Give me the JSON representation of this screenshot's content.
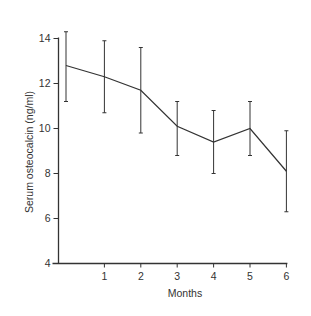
{
  "chart_data": {
    "type": "line",
    "title": "",
    "xlabel": "Months",
    "ylabel": "Serum osteocalcin (ng/ml)",
    "x": [
      0,
      1,
      2,
      3,
      4,
      5,
      6
    ],
    "x_tick_labels": [
      "1",
      "2",
      "3",
      "4",
      "5",
      "6"
    ],
    "x_ticks": [
      1,
      2,
      3,
      4,
      5,
      6
    ],
    "y_ticks": [
      4,
      6,
      8,
      10,
      12,
      14
    ],
    "y_tick_labels": [
      "4",
      "6",
      "8",
      "10",
      "12",
      "14"
    ],
    "ylim": [
      4,
      14
    ],
    "xlim": [
      0,
      6
    ],
    "grid": false,
    "legend": null,
    "series": [
      {
        "name": "Serum osteocalcin",
        "values": [
          12.8,
          12.3,
          11.7,
          10.1,
          9.4,
          10.0,
          8.1
        ],
        "error_upper": [
          14.3,
          13.9,
          13.6,
          11.2,
          10.8,
          11.2,
          9.9
        ],
        "error_lower": [
          11.2,
          10.7,
          9.8,
          8.8,
          8.0,
          8.8,
          6.3
        ]
      }
    ],
    "colors": {
      "line": "#333333",
      "axis": "#333333",
      "background": "#ffffff"
    }
  }
}
